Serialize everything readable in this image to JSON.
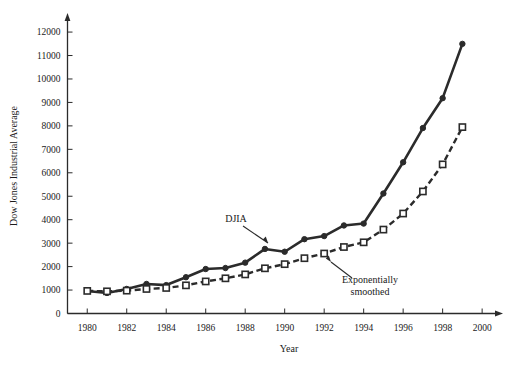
{
  "chart_data": {
    "type": "line",
    "title": "",
    "xlabel": "Year",
    "ylabel": "Dow Jones Industrial Average",
    "xlim": [
      1979,
      2000.5
    ],
    "ylim": [
      0,
      12600
    ],
    "grid": false,
    "legend_position": "inline-annotations",
    "x": [
      1980,
      1981,
      1982,
      1983,
      1984,
      1985,
      1986,
      1987,
      1988,
      1989,
      1990,
      1991,
      1992,
      1993,
      1994,
      1995,
      1996,
      1997,
      1998,
      1999
    ],
    "xticks": [
      1980,
      1982,
      1984,
      1986,
      1988,
      1990,
      1992,
      1994,
      1996,
      1998,
      2000
    ],
    "yticks": [
      0,
      1000,
      2000,
      3000,
      4000,
      5000,
      6000,
      7000,
      8000,
      9000,
      10000,
      11000,
      12000
    ],
    "series": [
      {
        "name": "DJIA",
        "marker": "filled-square-circle",
        "line_style": "solid",
        "color": "#2b2b2b",
        "values": [
          963,
          875,
          1047,
          1259,
          1212,
          1547,
          1896,
          1939,
          2169,
          2753,
          2634,
          3169,
          3301,
          3754,
          3834,
          5117,
          6448,
          7908,
          9181,
          11497
        ]
      },
      {
        "name": "Exponentially smoothed",
        "marker": "open-square",
        "line_style": "dashed",
        "color": "#2b2b2b",
        "values": [
          963,
          945,
          975,
          1046,
          1089,
          1200,
          1367,
          1500,
          1667,
          1927,
          2104,
          2358,
          2558,
          2835,
          3035,
          3578,
          4263,
          5204,
          6358,
          7948
        ]
      }
    ],
    "annotations": [
      {
        "text": "DJIA",
        "series": "DJIA",
        "at_x": 1992.4,
        "leader": true
      },
      {
        "text": "Exponentially",
        "series": "Exponentially smoothed",
        "at_x": 1995.0,
        "leader": true
      },
      {
        "text": "smoothed",
        "series": "Exponentially smoothed",
        "at_x": 1995.0,
        "leader": false
      }
    ]
  }
}
